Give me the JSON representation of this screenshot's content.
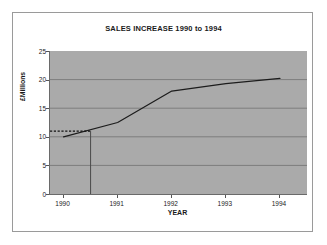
{
  "chart_data": {
    "type": "line",
    "title": "SALES INCREASE 1990 to 1994",
    "xlabel": "YEAR",
    "ylabel": "£Millions",
    "x": [
      1990,
      1991,
      1992,
      1993,
      1994
    ],
    "x_tick_labels": [
      "1990",
      "1991",
      "1992",
      "1993",
      "1994"
    ],
    "y_tick_labels": [
      "0",
      "5",
      "10",
      "15",
      "20",
      "25"
    ],
    "y_ticks": [
      0,
      5,
      10,
      15,
      20,
      25
    ],
    "ylim": [
      0,
      25
    ],
    "xlim": [
      1989.75,
      1994.5
    ],
    "grid": true,
    "legend": "none",
    "series": [
      {
        "name": "Sales",
        "values": [
          10.0,
          12.5,
          18.0,
          19.3,
          20.2
        ]
      }
    ],
    "annotations": [
      {
        "name": "reference-value-line",
        "style": "dashed",
        "orientation": "horizontal",
        "value": 11.0,
        "from_x": 1989.75,
        "to_x": 1990.5
      },
      {
        "name": "reference-year-line",
        "style": "solid",
        "orientation": "vertical",
        "value": 1990.5,
        "from_y": 0,
        "to_y": 11.0
      }
    ],
    "colors": {
      "plot_background": "#aaaaaa",
      "page_background": "#ffffff",
      "gridline": "#7d7d7d",
      "axis": "#6a6a6a",
      "series_line": "#1c1c1c",
      "frame_border": "#9a9a9a",
      "text": "#1a1a1a"
    }
  }
}
